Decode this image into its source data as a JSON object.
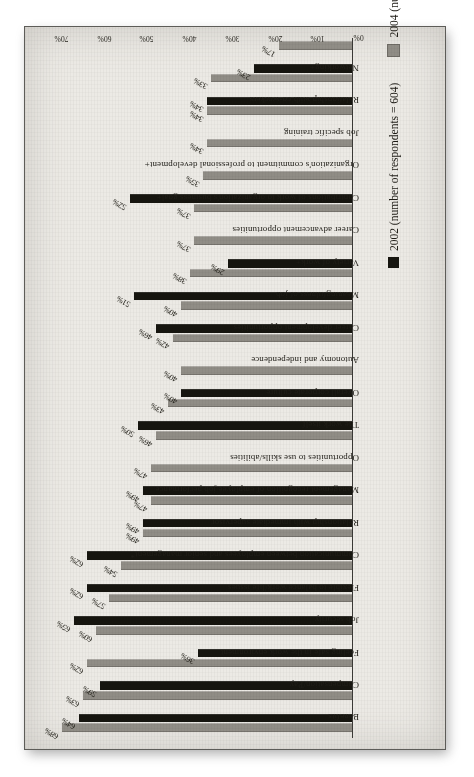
{
  "figure": {
    "background_color": "#eceae5",
    "paper_border_color": "#5d5c58"
  },
  "legend": {
    "position": "bottom-right",
    "items": [
      {
        "label": "2002 (number of respondents = 604)",
        "swatch": "black",
        "color": "#16150f"
      },
      {
        "label": "2004 (number of respondents = 604)",
        "swatch": "gray",
        "color": "#908d86"
      }
    ]
  },
  "axis": {
    "ticks": [
      "0%",
      "10%",
      "20%",
      "30%",
      "40%",
      "50%",
      "60%",
      "70%"
    ]
  },
  "chart_data": {
    "type": "bar",
    "title": "",
    "subtitle": "",
    "xlabel": "",
    "ylabel": "",
    "ylim": [
      0,
      70
    ],
    "grid": false,
    "legend_position": "bottom-right",
    "orientation": "vertical-bars-rotated-page",
    "tick_labels": [
      "0%",
      "10%",
      "20%",
      "30%",
      "40%",
      "50%",
      "60%",
      "70%"
    ],
    "categories": [
      "Benefits",
      "Compensation/Pay",
      "Feeling safe in the work environment",
      "Job security",
      "Flexible to balance work/life issues",
      "Communication between employees and senior management*",
      "Relationship with immediate supervisor",
      "Management recognition of employee job performance",
      "Opportunities to use skills/abilities",
      "The work itself",
      "Overall corporate culture",
      "Autonomy and independence",
      "Career development opportunities",
      "Meaningfulness of job",
      "Variety of work+",
      "Career advancement opportunities",
      "Contributions of work to organization's business goal+",
      "Organization's commitment to professional development+",
      "Job specific training",
      "Relationship with co-workers",
      "Networking+"
    ],
    "series": [
      {
        "name": "2002 (number of respondents = 604)",
        "color": "#16150f",
        "values": [
          64,
          59,
          36,
          65,
          62,
          62,
          49,
          49,
          null,
          50,
          40,
          null,
          46,
          51,
          29,
          null,
          52,
          null,
          null,
          34,
          23
        ]
      },
      {
        "name": "2004 (number of respondents = 604)",
        "color": "#908d86",
        "values": [
          68,
          63,
          62,
          60,
          57,
          54,
          49,
          47,
          47,
          46,
          43,
          40,
          42,
          40,
          38,
          37,
          37,
          35,
          34,
          34,
          33
        ]
      }
    ],
    "extra_bar": {
      "series": "2004 (number of respondents = 604)",
      "value": 17,
      "note": "final unlabeled 2004 bar"
    },
    "value_labels_2002": [
      "64%",
      "59%",
      "36%",
      "65%",
      "62%",
      "62%",
      "49%",
      "49%",
      "",
      "50%",
      "40%",
      "",
      "46%",
      "51%",
      "29%",
      "",
      "52%",
      "",
      "",
      "34%",
      "23%"
    ],
    "value_labels_2004": [
      "68%",
      "63%",
      "62%",
      "60%",
      "57%",
      "54%",
      "49%",
      "47%",
      "47%",
      "46%",
      "43%",
      "40%",
      "42%",
      "40%",
      "38%",
      "37%",
      "37%",
      "35%",
      "34%",
      "34%",
      "33%"
    ],
    "value_label_extra": "17%"
  }
}
